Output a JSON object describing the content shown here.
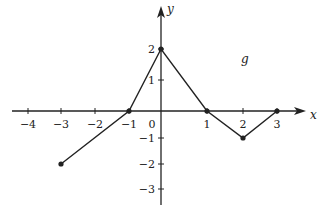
{
  "chart_data": {
    "type": "line",
    "title": "",
    "function_label": "g",
    "xlabel": "x",
    "ylabel": "y",
    "xlim": [
      -4,
      3
    ],
    "ylim": [
      -3,
      2
    ],
    "x_ticks": [
      -4,
      -3,
      -2,
      -1,
      0,
      1,
      2,
      3
    ],
    "y_ticks": [
      -3,
      -2,
      -1,
      1,
      2
    ],
    "x_tick_labels": [
      "−4",
      "−3",
      "−2",
      "−1",
      "0",
      "1",
      "2",
      "3"
    ],
    "y_tick_labels": [
      "−3",
      "−2",
      "−1",
      "1",
      "2"
    ],
    "grid": false,
    "series": [
      {
        "name": "g",
        "x": [
          -3,
          -1,
          0,
          1,
          2,
          3
        ],
        "y": [
          -2,
          0,
          2,
          0,
          -1,
          0
        ]
      }
    ]
  },
  "colors": {
    "line": "#222222",
    "axis": "#222222",
    "background": "#ffffff"
  }
}
